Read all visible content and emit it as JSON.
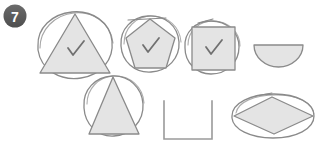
{
  "panel": {
    "badge_label": "7",
    "background_color": "#ffffff",
    "ink_color": "#8a8a8a",
    "ink_dark_color": "#6e6e6e",
    "fill_color": "#e4e4e4",
    "badge_color": "#595959",
    "check_color": "#707070"
  },
  "figures": [
    {
      "id": "figure-1",
      "name": "triangle-in-circle-checked",
      "inner_shape": "triangle",
      "outer_shape": "circle",
      "checked": true,
      "check_mark": "✓",
      "filled": true
    },
    {
      "id": "figure-2",
      "name": "pentagon-in-circle-checked",
      "inner_shape": "pentagon",
      "outer_shape": "circle",
      "checked": true,
      "check_mark": "✓",
      "filled": true
    },
    {
      "id": "figure-3",
      "name": "square-in-circle-checked",
      "inner_shape": "square",
      "outer_shape": "circle",
      "checked": true,
      "check_mark": "✓",
      "filled": true
    },
    {
      "id": "figure-4",
      "name": "semicircle",
      "inner_shape": "semicircle",
      "outer_shape": "none",
      "checked": false,
      "check_mark": "",
      "filled": true
    },
    {
      "id": "figure-5",
      "name": "triangle-in-circle",
      "inner_shape": "triangle",
      "outer_shape": "circle",
      "checked": false,
      "check_mark": "",
      "filled": true
    },
    {
      "id": "figure-6",
      "name": "open-square",
      "inner_shape": "open-square",
      "outer_shape": "none",
      "checked": false,
      "check_mark": "",
      "filled": false
    },
    {
      "id": "figure-7",
      "name": "rhombus-in-ellipse",
      "inner_shape": "rhombus",
      "outer_shape": "ellipse",
      "checked": false,
      "check_mark": "",
      "filled": true
    }
  ]
}
